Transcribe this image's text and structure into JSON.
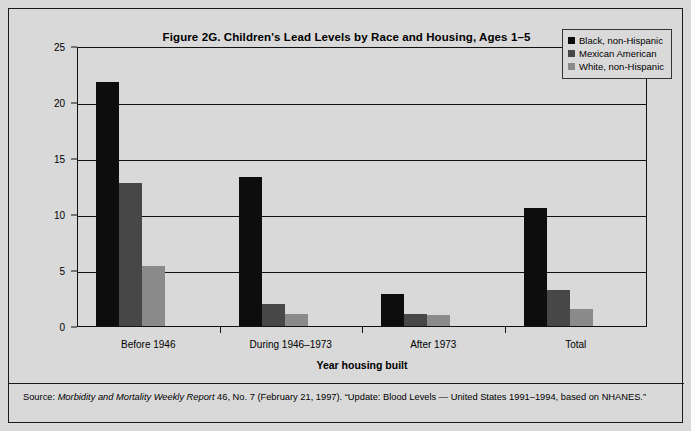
{
  "figure": {
    "title": "Figure 2G. Children's Lead Levels by Race and Housing, Ages 1–5",
    "background_color": "#d9d9d9",
    "frame_color": "#1a1a1a"
  },
  "source_note": {
    "prefix": "Source: ",
    "italic_part": "Morbidity and Mortality Weekly Report",
    "rest": " 46, No. 7 (February 21, 1997).  “Update: Blood Levels — United States 1991–1994, based on NHANES.”"
  },
  "legend": {
    "position": "top-right",
    "items": [
      {
        "label": "Black, non-Hispanic",
        "color": "#0d0d0d"
      },
      {
        "label": "Mexican American",
        "color": "#474747"
      },
      {
        "label": "White, non-Hispanic",
        "color": "#8a8a8a"
      }
    ]
  },
  "chart_data": {
    "type": "bar",
    "title": "Figure 2G. Children's Lead Levels by Race and Housing, Ages 1–5",
    "xlabel": "Year housing built",
    "ylabel": "Percent of children with elevated blood lead levels",
    "categories": [
      "Before 1946",
      "During 1946–1973",
      "After 1973",
      "Total"
    ],
    "series": [
      {
        "name": "Black, non-Hispanic",
        "color": "#0d0d0d",
        "values": [
          21.8,
          13.3,
          2.9,
          10.5
        ]
      },
      {
        "name": "Mexican American",
        "color": "#474747",
        "values": [
          12.8,
          2.0,
          1.1,
          3.2
        ]
      },
      {
        "name": "White, non-Hispanic",
        "color": "#8a8a8a",
        "values": [
          5.4,
          1.1,
          1.0,
          1.5
        ]
      }
    ],
    "ylim": [
      0,
      25
    ],
    "yticks": [
      0,
      5,
      10,
      15,
      20,
      25
    ],
    "ytick_labels": [
      "0",
      "5",
      "10",
      "15",
      "20",
      "25"
    ],
    "grid": true,
    "legend_position": "upper right"
  }
}
